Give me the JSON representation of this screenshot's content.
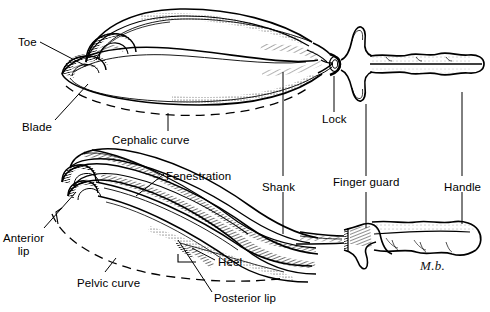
{
  "figure": {
    "signature": "M.b.",
    "background_color": "#ffffff",
    "ink_color": "#000000",
    "views": [
      {
        "name": "upper-view",
        "description": "Assembled forceps seen from above: fenestrated cephalic blades, shanks, lock, finger guard, handle"
      },
      {
        "name": "lower-view",
        "description": "Forceps blades in perspective showing pelvic curve, anterior lip, heel, posterior lip"
      }
    ]
  },
  "labels": [
    {
      "id": "toe",
      "text": "Toe",
      "x": 18,
      "y": 36,
      "lines": [
        "Toe"
      ]
    },
    {
      "id": "blade",
      "text": "Blade",
      "x": 22,
      "y": 121,
      "lines": [
        "Blade"
      ]
    },
    {
      "id": "cephalic",
      "text": "Cephalic curve",
      "x": 112,
      "y": 134,
      "lines": [
        "Cephalic curve"
      ]
    },
    {
      "id": "lock",
      "text": "Lock",
      "x": 322,
      "y": 118,
      "lines": [
        "Lock"
      ]
    },
    {
      "id": "shank",
      "text": "Shank",
      "x": 262,
      "y": 181,
      "lines": [
        "Shank"
      ]
    },
    {
      "id": "finger-guard",
      "text": "Finger guard",
      "x": 333,
      "y": 181,
      "lines": [
        "Finger guard"
      ]
    },
    {
      "id": "handle",
      "text": "Handle",
      "x": 444,
      "y": 181,
      "lines": [
        "Handle"
      ]
    },
    {
      "id": "fenestration",
      "text": "Fenestration",
      "x": 166,
      "y": 170,
      "lines": [
        "Fenestration"
      ]
    },
    {
      "id": "anterior-lip",
      "text": "Anterior lip",
      "x": 3,
      "y": 232,
      "lines": [
        "Anterior",
        "lip"
      ]
    },
    {
      "id": "pelvic-curve",
      "text": "Pelvic curve",
      "x": 77,
      "y": 277,
      "lines": [
        "Pelvic curve"
      ]
    },
    {
      "id": "heel",
      "text": "Heel",
      "x": 218,
      "y": 258,
      "lines": [
        "Heel"
      ]
    },
    {
      "id": "posterior-lip",
      "text": "Posterior lip",
      "x": 214,
      "y": 295,
      "lines": [
        "Posterior lip"
      ]
    }
  ]
}
